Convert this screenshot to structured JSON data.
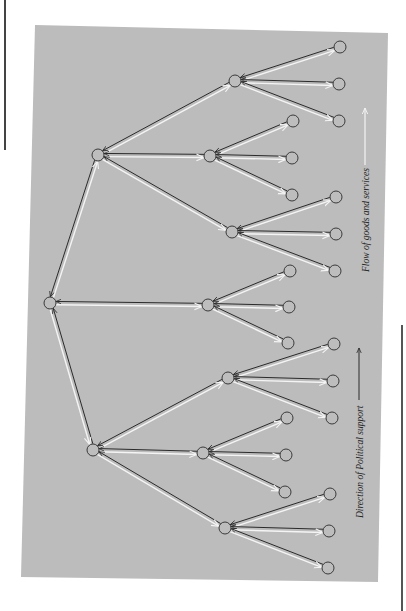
{
  "figure": {
    "panel_color": "#bcbcbc",
    "node_fill": "#bdbdbd",
    "node_stroke": "#3a3a3a",
    "political_arrow_color": "#2a2a2a",
    "goods_arrow_color": "#f4f4f4"
  },
  "labels": {
    "goods_flow": "Flow of goods and services",
    "political_support": "Direction of Political support"
  },
  "tree": {
    "root": {
      "id": "root",
      "x": 50,
      "y": 303
    },
    "level1": [
      {
        "id": "A",
        "x": 98,
        "y": 155
      },
      {
        "id": "B",
        "x": 208,
        "y": 305
      },
      {
        "id": "C",
        "x": 93,
        "y": 450
      }
    ],
    "level2": [
      {
        "id": "A1",
        "parent": "A",
        "x": 235,
        "y": 81
      },
      {
        "id": "A2",
        "parent": "A",
        "x": 210,
        "y": 156
      },
      {
        "id": "A3",
        "parent": "A",
        "x": 232,
        "y": 232
      },
      {
        "id": "C1",
        "parent": "C",
        "x": 228,
        "y": 378
      },
      {
        "id": "C2",
        "parent": "C",
        "x": 203,
        "y": 453
      },
      {
        "id": "C3",
        "parent": "C",
        "x": 225,
        "y": 528
      }
    ],
    "leaves": [
      {
        "parent": "A1",
        "x": 340,
        "y": 47
      },
      {
        "parent": "A1",
        "x": 339,
        "y": 84
      },
      {
        "parent": "A1",
        "x": 339,
        "y": 121
      },
      {
        "parent": "A2",
        "x": 293,
        "y": 121
      },
      {
        "parent": "A2",
        "x": 292,
        "y": 158
      },
      {
        "parent": "A2",
        "x": 292,
        "y": 195
      },
      {
        "parent": "A3",
        "x": 336,
        "y": 197
      },
      {
        "parent": "A3",
        "x": 336,
        "y": 234
      },
      {
        "parent": "A3",
        "x": 335,
        "y": 271
      },
      {
        "parent": "B",
        "x": 290,
        "y": 271
      },
      {
        "parent": "B",
        "x": 289,
        "y": 307
      },
      {
        "parent": "B",
        "x": 288,
        "y": 343
      },
      {
        "parent": "C1",
        "x": 334,
        "y": 344
      },
      {
        "parent": "C1",
        "x": 333,
        "y": 381
      },
      {
        "parent": "C1",
        "x": 332,
        "y": 418
      },
      {
        "parent": "C2",
        "x": 287,
        "y": 418
      },
      {
        "parent": "C2",
        "x": 286,
        "y": 455
      },
      {
        "parent": "C2",
        "x": 285,
        "y": 492
      },
      {
        "parent": "C3",
        "x": 330,
        "y": 494
      },
      {
        "parent": "C3",
        "x": 329,
        "y": 531
      },
      {
        "parent": "C3",
        "x": 328,
        "y": 568
      }
    ]
  }
}
